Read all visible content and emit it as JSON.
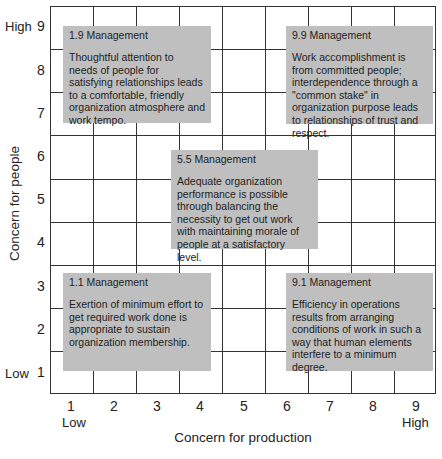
{
  "diagram": {
    "type": "managerial-grid",
    "x_axis": {
      "label": "Concern for production",
      "ticks": [
        "1",
        "2",
        "3",
        "4",
        "5",
        "6",
        "7",
        "8",
        "9"
      ],
      "low_label": "Low",
      "high_label": "High"
    },
    "y_axis": {
      "label": "Concern for people",
      "ticks": [
        "1",
        "2",
        "3",
        "4",
        "5",
        "6",
        "7",
        "8",
        "9"
      ],
      "low_label": "Low",
      "high_label": "High"
    },
    "styles": [
      {
        "id": "1.9",
        "title": "1.9 Management",
        "description": "Thoughtful attention to needs of people for satisfying relationships leads to a comfortable, friendly organization atmosphere and work tempo.",
        "production": 1,
        "people": 9
      },
      {
        "id": "9.9",
        "title": "9.9 Management",
        "description": "Work accomplishment is from committed people; interdependence through a \"common stake\" in organization purpose leads to relationships of trust and respect.",
        "production": 9,
        "people": 9
      },
      {
        "id": "5.5",
        "title": "5.5 Management",
        "description": "Adequate organization performance is possible through balancing the necessity to get out work with maintaining morale of people at a satisfactory level.",
        "production": 5,
        "people": 5
      },
      {
        "id": "1.1",
        "title": "1.1 Management",
        "description": "Exertion of minimum effort to get required work done is appropriate to sustain organization membership.",
        "production": 1,
        "people": 1
      },
      {
        "id": "9.1",
        "title": "9.1 Management",
        "description": "Efficiency in operations results from arranging conditions of work in such a way that human elements interfere to a minimum degree.",
        "production": 9,
        "people": 1
      }
    ],
    "colors": {
      "box_fill": "#bfbfbf",
      "grid_line": "#333333",
      "background": "#ffffff"
    }
  }
}
